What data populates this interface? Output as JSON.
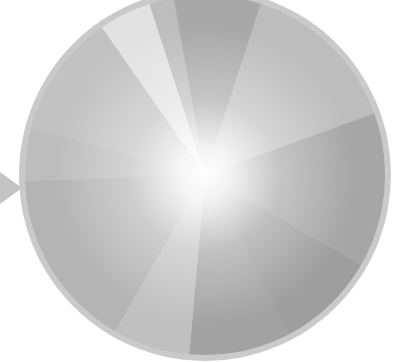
{
  "graphic": {
    "type": "radial-wedge-disc",
    "center": [
      205,
      175
    ],
    "radius": 186,
    "rim_color": "#c8c8c8",
    "base_color": "#bdbdbd",
    "glow_color": "#ffffff",
    "pointer": {
      "side": "left",
      "color": "#c4c4c4"
    },
    "wedges": [
      {
        "name": "top-dark",
        "start_deg": -100,
        "end_deg": -72,
        "color": "#a8a8a8"
      },
      {
        "name": "top-light",
        "start_deg": -125,
        "end_deg": -108,
        "color": "#e2e2e2"
      },
      {
        "name": "upper-left",
        "start_deg": -165,
        "end_deg": -125,
        "color": "#c2c2c2"
      },
      {
        "name": "right-band",
        "start_deg": -20,
        "end_deg": 30,
        "color": "#a6a6a6"
      },
      {
        "name": "lower-right",
        "start_deg": 30,
        "end_deg": 62,
        "color": "#9e9e9e"
      },
      {
        "name": "bottom-center",
        "start_deg": 62,
        "end_deg": 95,
        "color": "#a2a2a2"
      },
      {
        "name": "bottom-left",
        "start_deg": 95,
        "end_deg": 120,
        "color": "#c0c0c0"
      },
      {
        "name": "left-lower",
        "start_deg": 120,
        "end_deg": 178,
        "color": "#b4b4b4"
      }
    ]
  }
}
